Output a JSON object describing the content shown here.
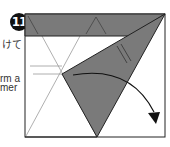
{
  "step": {
    "number": "11"
  },
  "side_text": {
    "line1": "けて",
    "line2": "rm a",
    "line3": "mer"
  },
  "colors": {
    "paper": "#ffffff",
    "shaded": "#7a7a7a",
    "outline": "#222222",
    "crease": "#9a9a9a",
    "badge": "#111111"
  },
  "icons": {
    "fold_arrow": "curved-arrow-down-right"
  }
}
